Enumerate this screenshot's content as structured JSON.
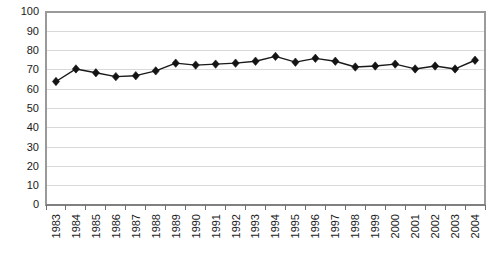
{
  "chart_data": {
    "type": "line",
    "title": "",
    "subtitle": "",
    "xlabel": "",
    "ylabel": "",
    "categories": [
      "1983",
      "1984",
      "1985",
      "1986",
      "1987",
      "1988",
      "1989",
      "1990",
      "1991",
      "1992",
      "1993",
      "1994",
      "1995",
      "1996",
      "1997",
      "1998",
      "1999",
      "2000",
      "2001",
      "2002",
      "2003",
      "2004"
    ],
    "series": [
      {
        "name": "",
        "values": [
          64,
          70.5,
          68.5,
          66.5,
          67,
          69.5,
          73.5,
          72.5,
          73,
          73.5,
          74.5,
          77,
          74,
          76,
          74.5,
          71.5,
          72,
          73,
          70.5,
          72,
          70.5,
          75
        ]
      }
    ],
    "ylim": [
      0,
      100
    ],
    "yticks": [
      0,
      10,
      20,
      30,
      40,
      50,
      60,
      70,
      80,
      90,
      100
    ],
    "ytick_labels": [
      "0",
      "10",
      "20",
      "30",
      "40",
      "50",
      "60",
      "70",
      "80",
      "90",
      "100"
    ],
    "xtick_labels": [
      "1983",
      "1984",
      "1985",
      "1986",
      "1987",
      "1988",
      "1989",
      "1990",
      "1991",
      "1992",
      "1993",
      "1994",
      "1995",
      "1996",
      "1997",
      "1998",
      "1999",
      "2000",
      "2001",
      "2002",
      "2003",
      "2004"
    ],
    "grid": true,
    "grid_axis": "y",
    "legend": false,
    "legend_position": "none",
    "marker": "diamond",
    "annotations": []
  },
  "style": {
    "background": "#ffffff",
    "line_color": "#1a1a1a",
    "marker_color": "#141414",
    "grid_color": "#d9d9d9",
    "axis_color": "#808080",
    "border_color": "#9a9a9a",
    "text_color": "#1a1a1a"
  },
  "xaxis_label_rotation": "-90"
}
